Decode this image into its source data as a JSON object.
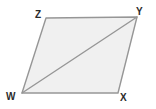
{
  "figure": {
    "name": "parallelogram-wxyz-with-diagonal",
    "shape_type": "parallelogram",
    "background_color": "#ffffff",
    "fill_color": "#f0f0f0",
    "stroke_color": "#969696",
    "label_color": "#2b2b2b",
    "stroke_width": 1.4,
    "vertices": [
      {
        "id": "w",
        "label": "W",
        "x": 22,
        "y": 93,
        "label_x": 6,
        "label_y": 92
      },
      {
        "id": "x",
        "label": "X",
        "x": 118,
        "y": 93,
        "label_x": 120,
        "label_y": 93
      },
      {
        "id": "y",
        "label": "Y",
        "x": 137,
        "y": 17,
        "label_x": 136,
        "label_y": 7
      },
      {
        "id": "z",
        "label": "Z",
        "x": 46,
        "y": 18,
        "label_x": 35,
        "label_y": 10
      }
    ],
    "outline_points": "46,18 137,17 118,93 22,93",
    "diagonal": {
      "name": "diagonal-wy",
      "from": "W",
      "to": "Y",
      "x1": 22,
      "y1": 93,
      "x2": 137,
      "y2": 17
    },
    "edges": [
      {
        "name": "edge-zy",
        "from": "Z",
        "to": "Y"
      },
      {
        "name": "edge-yx",
        "from": "Y",
        "to": "X"
      },
      {
        "name": "edge-xw",
        "from": "X",
        "to": "W"
      },
      {
        "name": "edge-wz",
        "from": "W",
        "to": "Z"
      }
    ]
  }
}
